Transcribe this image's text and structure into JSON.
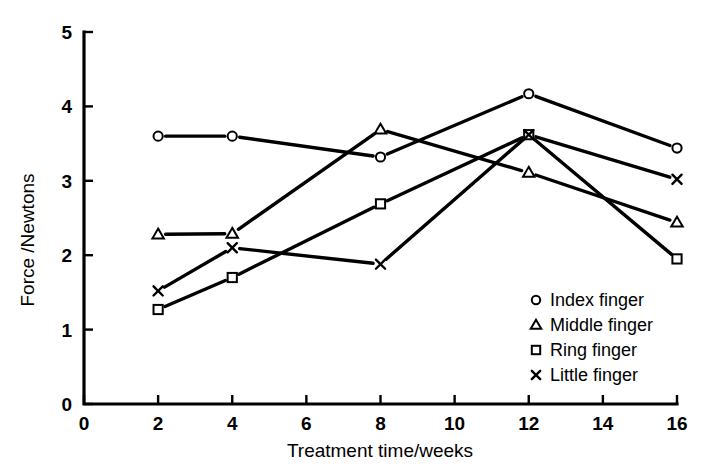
{
  "chart_data": {
    "type": "line",
    "title": "",
    "xlabel": "Treatment time/weeks",
    "ylabel": "Force /Newtons",
    "x": [
      2,
      4,
      8,
      12,
      16
    ],
    "xlim": [
      0,
      16
    ],
    "ylim": [
      0,
      5
    ],
    "xticks": [
      0,
      2,
      4,
      6,
      8,
      10,
      12,
      14,
      16
    ],
    "yticks": [
      0,
      1,
      2,
      3,
      4,
      5
    ],
    "xtick_labels": [
      "0",
      "2",
      "4",
      "6",
      "8",
      "10",
      "12",
      "14",
      "16"
    ],
    "ytick_labels": [
      "0",
      "1",
      "2",
      "3",
      "4",
      "5"
    ],
    "grid": false,
    "legend_position": "lower right",
    "series": [
      {
        "name": "Index finger",
        "marker": "circle",
        "values": [
          3.6,
          3.6,
          3.32,
          4.17,
          3.44
        ]
      },
      {
        "name": "Middle finger",
        "marker": "triangle",
        "values": [
          2.28,
          2.29,
          3.69,
          3.11,
          2.44
        ]
      },
      {
        "name": "Ring finger",
        "marker": "square",
        "values": [
          1.27,
          1.7,
          2.69,
          3.62,
          1.95
        ]
      },
      {
        "name": "Little finger",
        "marker": "x",
        "values": [
          1.52,
          2.1,
          1.88,
          3.62,
          3.02
        ]
      }
    ]
  },
  "legend": {
    "entries": [
      {
        "label": "Index finger",
        "marker": "circle"
      },
      {
        "label": "Middle finger",
        "marker": "triangle"
      },
      {
        "label": "Ring finger",
        "marker": "square"
      },
      {
        "label": "Little finger",
        "marker": "x"
      }
    ]
  },
  "colors": {
    "ink": "#000000",
    "background": "#ffffff"
  }
}
